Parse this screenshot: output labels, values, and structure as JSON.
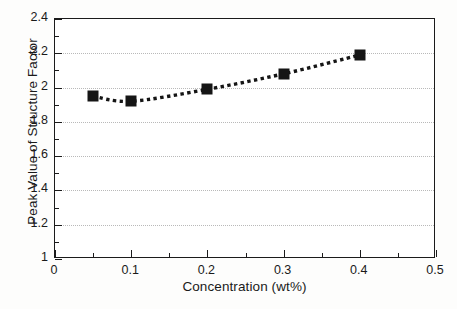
{
  "chart_data": {
    "type": "line",
    "title": "",
    "xlabel": "Concentration (wt%)",
    "ylabel": "Peak Value of Structure Factor",
    "x": [
      0.05,
      0.1,
      0.2,
      0.3,
      0.4
    ],
    "values": [
      1.95,
      1.92,
      1.99,
      2.08,
      2.19
    ],
    "series": [
      {
        "name": "Peak Value of Structure Factor",
        "x": [
          0.05,
          0.1,
          0.2,
          0.3,
          0.4
        ],
        "values": [
          1.95,
          1.92,
          1.99,
          2.08,
          2.19
        ],
        "marker": "filled-square",
        "marker_color": "#151515",
        "line_style": "dotted",
        "line_color": "#151515"
      }
    ],
    "xlim": [
      0,
      0.5
    ],
    "ylim": [
      1,
      2.4
    ],
    "xticks": [
      0,
      0.1,
      0.2,
      0.3,
      0.4,
      0.5
    ],
    "xtick_labels": [
      "0",
      "0.1",
      "0.2",
      "0.3",
      "0.4",
      "0.5"
    ],
    "xticks_minor": [
      0.05,
      0.15,
      0.25,
      0.35,
      0.45
    ],
    "yticks": [
      1,
      1.2,
      1.4,
      1.6,
      1.8,
      2,
      2.2,
      2.4
    ],
    "ytick_labels": [
      "1",
      "1.2",
      "1.4",
      "1.6",
      "1.8",
      "2",
      "2.2",
      "2.4"
    ],
    "yticks_minor": [
      1.1,
      1.3,
      1.5,
      1.7,
      1.9,
      2.1,
      2.3
    ],
    "grid": {
      "horizontal": true,
      "vertical": false,
      "style": "dotted",
      "color": "#b9b9b9"
    },
    "legend": null,
    "annotations": [],
    "frame_color": "#1b1b1b",
    "background_color": "#ffffff"
  }
}
